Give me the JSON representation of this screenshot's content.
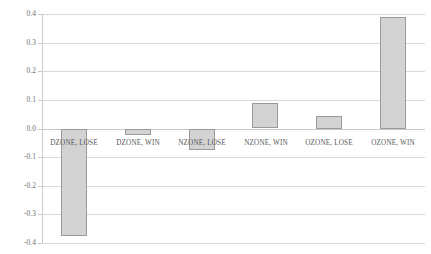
{
  "chart_data": {
    "type": "bar",
    "title": "",
    "subtitle": "",
    "xlabel": "",
    "ylabel": "",
    "categories": [
      "DZONE, LOSE",
      "DZONE, WIN",
      "NZONE, LOSE",
      "NZONE, WIN",
      "OZONE, LOSE",
      "OZONE, WIN"
    ],
    "values": [
      -0.375,
      -0.02,
      -0.075,
      0.088,
      0.045,
      0.39
    ],
    "ylim": [
      -0.4,
      0.4
    ],
    "yticks": [
      0.4,
      0.3,
      0.2,
      0.1,
      0.0,
      -0.1,
      -0.2,
      -0.3,
      -0.4
    ],
    "ytick_labels": [
      "0.4",
      "0.3",
      "0.2",
      "0.1",
      "0.0",
      "-0.1",
      "-0.2",
      "-0.3",
      "-0.4"
    ],
    "grid": true,
    "grid_axis": "y",
    "legend": false,
    "legend_position": "none",
    "bar_color": "#a6a6a6",
    "bar_border_color": "#9a9a9a",
    "gridline_color": "#d9d9d9",
    "axis_color": "#c9c9c9",
    "label_color": "#6d6d6d",
    "category_label_color": "#585858",
    "background_color": "#ffffff",
    "series": [
      {
        "name": "value",
        "values": [
          -0.375,
          -0.02,
          -0.075,
          0.088,
          0.045,
          0.39
        ]
      }
    ]
  }
}
